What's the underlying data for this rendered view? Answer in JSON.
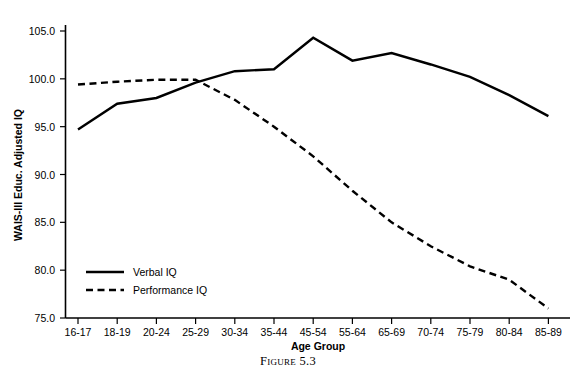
{
  "figure": {
    "caption": "Figure 5.3"
  },
  "chart_data": {
    "type": "line",
    "title": "",
    "xlabel": "Age Group",
    "ylabel": "WAIS-III Educ. Adjusted IQ",
    "categories": [
      "16-17",
      "18-19",
      "20-24",
      "25-29",
      "30-34",
      "35-44",
      "45-54",
      "55-64",
      "65-69",
      "70-74",
      "75-79",
      "80-84",
      "85-89"
    ],
    "series": [
      {
        "name": "Verbal IQ",
        "style": "solid",
        "values": [
          94.7,
          97.4,
          98.0,
          99.6,
          100.8,
          101.0,
          104.3,
          101.9,
          102.7,
          101.5,
          100.2,
          98.3,
          96.1
        ]
      },
      {
        "name": "Performance IQ",
        "style": "dashed",
        "values": [
          99.4,
          99.7,
          99.9,
          99.9,
          97.8,
          95.0,
          91.9,
          88.3,
          85.0,
          82.5,
          80.4,
          79.0,
          76.0
        ]
      }
    ],
    "ylim": [
      75.0,
      105.0
    ],
    "yticks": [
      75.0,
      80.0,
      85.0,
      90.0,
      95.0,
      100.0,
      105.0
    ],
    "ytick_labels": [
      "75.0",
      "80.0",
      "85.0",
      "90.0",
      "95.0",
      "100.0",
      "105.0"
    ],
    "grid": false,
    "legend_position": "bottom-left",
    "legend": [
      "Verbal IQ",
      "Performance IQ"
    ],
    "line_color": "#000000",
    "background_color": "#ffffff"
  }
}
